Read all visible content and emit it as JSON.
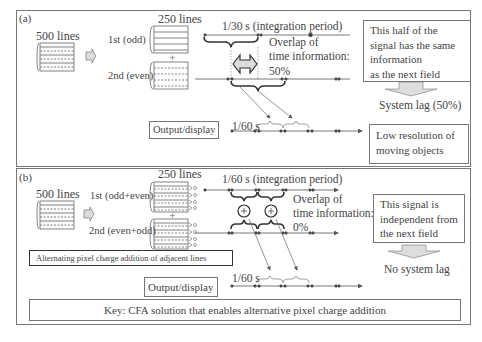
{
  "panel_a": {
    "label": "(a)",
    "source_lines": "500 lines",
    "field_lines": "250 lines",
    "field1_label": "1st (odd)",
    "field2_label": "2nd (even)",
    "period_label": "1/30 s (integration period)",
    "overlap_label": "Overlap of\ntime information:\n50%",
    "overlap_line1": "Overlap of",
    "overlap_line2": "time information:",
    "overlap_line3": "50%",
    "note_box": "This half of the\nsignal has the same\ninformation\nas the next field",
    "lag_label": "System lag (50%)",
    "output_label": "Output/display",
    "output_period": "1/60 s",
    "result_box": "Low resolution of\nmoving objects"
  },
  "panel_b": {
    "label": "(b)",
    "source_lines": "500 lines",
    "field_lines": "250 lines",
    "field1_label": "1st (odd+even)",
    "field2_label": "2nd (even+odd)",
    "period_label": "1/60 s (integration period)",
    "overlap_line1": "Overlap of",
    "overlap_line2": "time information:",
    "overlap_line3": "0%",
    "note_box": "This signal is\nindependent from\nthe next field",
    "lag_label": "No system lag",
    "method_box": "Alternating pixel charge addition of adjacent lines",
    "output_label": "Output/display",
    "output_period": "1/60 s",
    "key_box": "Key: CFA solution that enables alternative pixel charge addition"
  },
  "colors": {
    "border": "#777777",
    "text": "#444444",
    "arrow_fill": "#dddddd",
    "line": "#555555"
  }
}
